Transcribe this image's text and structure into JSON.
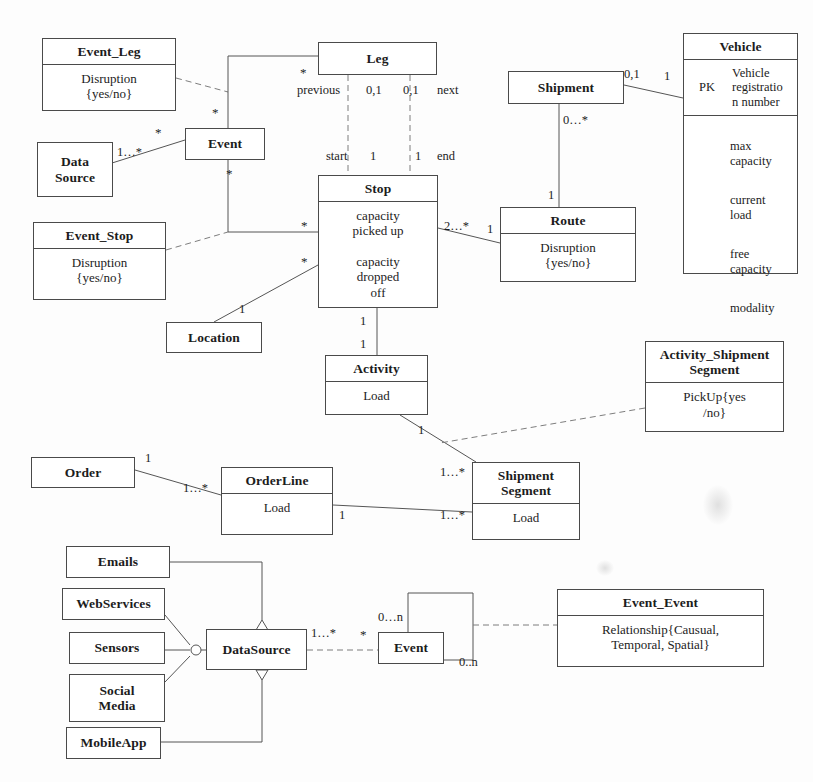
{
  "diagram": {
    "type": "uml-class-diagram",
    "background": "#fdfdfd",
    "line_color": "#555555",
    "border_color": "#4a4a4a",
    "text_color": "#1c1c1c"
  },
  "classes": {
    "event_leg": {
      "name": "Event_Leg",
      "body": "Disruption\n{yes/no}"
    },
    "data_source_top": {
      "name": "Data\nSource",
      "body": ""
    },
    "event_top": {
      "name": "Event",
      "body": ""
    },
    "event_stop": {
      "name": "Event_Stop",
      "body": "Disruption\n{yes/no}"
    },
    "location": {
      "name": "Location",
      "body": ""
    },
    "leg": {
      "name": "Leg",
      "body": ""
    },
    "stop": {
      "name": "Stop",
      "body": "capacity\npicked up\n\ncapacity\ndropped\noff"
    },
    "shipment": {
      "name": "Shipment",
      "body": ""
    },
    "route": {
      "name": "Route",
      "body": "Disruption\n{yes/no}"
    },
    "vehicle": {
      "name": "Vehicle",
      "pk_key": "PK",
      "pk_value": "Vehicle\nregistratio\nn number",
      "attributes": [
        "max\ncapacity",
        "current\nload",
        "free\ncapacity",
        "modality"
      ]
    },
    "activity": {
      "name": "Activity",
      "body": "Load"
    },
    "activity_shipment_segment": {
      "name": "Activity_Shipment\nSegment",
      "body": "PickUp{yes\n/no}"
    },
    "order": {
      "name": "Order",
      "body": ""
    },
    "order_line": {
      "name": "OrderLine",
      "body": "Load"
    },
    "shipment_segment": {
      "name": "Shipment\nSegment",
      "body": "Load"
    },
    "emails": {
      "name": "Emails",
      "body": ""
    },
    "webservices": {
      "name": "WebServices",
      "body": ""
    },
    "sensors": {
      "name": "Sensors",
      "body": ""
    },
    "social_media": {
      "name": "Social\nMedia",
      "body": ""
    },
    "mobileapp": {
      "name": "MobileApp",
      "body": ""
    },
    "datasource": {
      "name": "DataSource",
      "body": ""
    },
    "event_bottom": {
      "name": "Event",
      "body": ""
    },
    "event_event": {
      "name": "Event_Event",
      "body": "Relationship{Causual,\nTemporal, Spatial}"
    }
  },
  "multiplicities": {
    "event_leg_star": "*",
    "event_top_star_left": "*",
    "event_top_star_below": "*",
    "data_source_many": "1…*",
    "leg_star": "*",
    "leg_previous_role": "previous",
    "leg_previous_mult": "0,1",
    "leg_next_mult": "0,1",
    "leg_next_role": "next",
    "stop_start_role": "start",
    "stop_start_mult": "1",
    "stop_end_mult": "1",
    "stop_end_role": "end",
    "stop_star_upper": "*",
    "stop_star_lower": "*",
    "location_one": "1",
    "stop_route_many": "2…*",
    "route_one": "1",
    "route_top_one": "1",
    "shipment_route_many": "0…*",
    "shipment_vehicle_mult": "0,1",
    "vehicle_one": "1",
    "stop_activity_one": "1",
    "activity_top_one": "1",
    "activity_bottom_one": "1",
    "order_one": "1",
    "order_line_many": "1…*",
    "order_line_one": "1",
    "segment_many_upper": "1…*",
    "segment_many_lower": "1…*",
    "datasource_many": "1…*",
    "event_bottom_star": "*",
    "event_self_upper": "0…n",
    "event_self_lower": "0..n"
  }
}
